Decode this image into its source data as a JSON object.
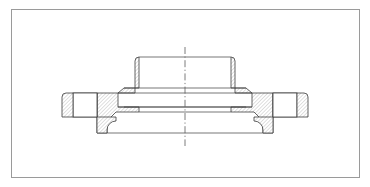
{
  "document": {
    "title": "Flange Sectional View",
    "view_type": "cross-section",
    "part_name": "pipe flange",
    "projection": "half-section mirrored about vertical axis",
    "background_color": "#ffffff"
  },
  "frame": {
    "name": "drawing-border",
    "x": 11,
    "y": 9,
    "width": 348,
    "height": 168,
    "stroke_color": "#9a9a9a",
    "stroke_width": 1,
    "fill_color": "#ffffff"
  },
  "style": {
    "outline_color": "#3c3c3c",
    "outline_width": 0.8,
    "hatch_color": "#6e6e6e",
    "hatch_width": 0.45,
    "hatch_angle_deg": 45,
    "hatch_spacing": 2.6,
    "centerline_color": "#5a5a5a",
    "centerline_dash": "7 2.5 1.2 2.5"
  },
  "centerline": {
    "name": "axis-centerline",
    "x": 185,
    "y_top": 47,
    "y_bottom": 146,
    "orientation": "vertical"
  },
  "geometry": {
    "axis_x": 185,
    "hub_top_y": 57,
    "hub_outer_half_width": 50,
    "hub_inner_half_width": 34,
    "hub_corner_chamfer": 4,
    "bore_top_y": 88,
    "bore_bottom_y": 107,
    "bore_half_width": 33,
    "bore_chamfer_half_width": 27,
    "bore_chamfer_depth": 5,
    "body_mid_y": 112,
    "rim_top_y": 93,
    "rim_bottom_y": 117,
    "rim_outer_half_width": 123,
    "bolt_gap_inner_half_width": 88,
    "bolt_gap_outer_half_width": 112,
    "base_top_y": 117,
    "base_bottom_y": 133,
    "base_half_width": 78,
    "fillet_radius": 9
  },
  "features": [
    {
      "name": "drawing-border",
      "label": "Drawing border frame",
      "description": "Thin light gray rectangular frame enclosing the drawing area"
    },
    {
      "name": "axis-centerline",
      "label": "Axis of revolution",
      "description": "Vertical dash-dot centerline marking the rotational symmetry axis"
    },
    {
      "name": "hub-left",
      "label": "Hub wall (left)",
      "description": "Hatched raised hub on the left of the axis with chamfered top outer corner"
    },
    {
      "name": "hub-right",
      "label": "Hub wall (right)",
      "description": "Hatched raised hub on the right of the axis, mirror of the left"
    },
    {
      "name": "bore-void",
      "label": "Central bore",
      "description": "Unhatched through bore with chamfered entries at top and bottom"
    },
    {
      "name": "rim-left",
      "label": "Flange rim (left)",
      "description": "Hatched outer rim wing extending left, interrupted by a bolt hole gap"
    },
    {
      "name": "rim-right",
      "label": "Flange rim (right)",
      "description": "Hatched outer rim wing extending right, interrupted by a bolt hole gap"
    },
    {
      "name": "bolt-hole-left",
      "label": "Bolt hole (left)",
      "description": "Unhatched rectangular void in the left rim representing a bolt hole in section"
    },
    {
      "name": "bolt-hole-right",
      "label": "Bolt hole (right)",
      "description": "Unhatched rectangular void in the right rim representing a bolt hole in section"
    },
    {
      "name": "base-face",
      "label": "Raised base face",
      "description": "Lower raised face with concave fillet transitions up to the flange body"
    }
  ]
}
